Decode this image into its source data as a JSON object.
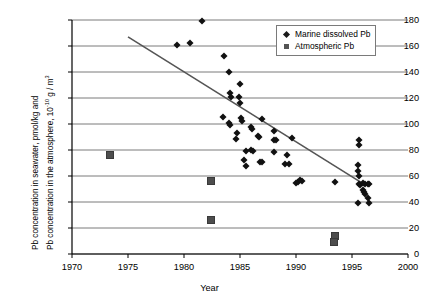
{
  "chart_data": {
    "type": "scatter",
    "title": "",
    "xlabel": "Year",
    "ylabel_line1": "Pb concentration in seawater, pmol/kg and",
    "ylabel_line2_pre": "Pb concentration in the atmosphere, 10",
    "ylabel_line2_sup": "-10",
    "ylabel_line2_post": " g / m",
    "ylabel_line2_sup2": "3",
    "xlim": [
      1970,
      2000
    ],
    "ylim": [
      0,
      180
    ],
    "xticks": [
      1970,
      1975,
      1980,
      1985,
      1990,
      1995,
      2000
    ],
    "yticks": [
      0,
      20,
      40,
      60,
      80,
      100,
      120,
      140,
      160,
      180
    ],
    "grid": "horizontal",
    "legend_position": "top-right",
    "colors": {
      "marine": "#111111",
      "atmospheric": "#4d4d4d",
      "trendline": "#555555",
      "grid": "#7a7a7a",
      "axis": "#000000"
    },
    "series": [
      {
        "name": "Marine dissolved Pb",
        "marker": "diamond",
        "points": [
          [
            1981.6,
            179.0
          ],
          [
            1979.4,
            160.5
          ],
          [
            1980.5,
            162.5
          ],
          [
            1983.6,
            152.5
          ],
          [
            1984.0,
            140.0
          ],
          [
            1985.0,
            131.0
          ],
          [
            1984.1,
            123.5
          ],
          [
            1984.2,
            120.5
          ],
          [
            1984.9,
            121.0
          ],
          [
            1985.0,
            116.0
          ],
          [
            1983.5,
            105.5
          ],
          [
            1984.0,
            100.5
          ],
          [
            1984.1,
            99.5
          ],
          [
            1985.1,
            104.5
          ],
          [
            1985.2,
            102.5
          ],
          [
            1987.0,
            103.5
          ],
          [
            1984.7,
            93.0
          ],
          [
            1986.0,
            97.5
          ],
          [
            1986.1,
            96.0
          ],
          [
            1984.6,
            88.5
          ],
          [
            1988.0,
            95.0
          ],
          [
            1986.6,
            91.0
          ],
          [
            1986.7,
            90.0
          ],
          [
            1988.0,
            88.0
          ],
          [
            1988.2,
            87.5
          ],
          [
            1989.6,
            89.5
          ],
          [
            1985.5,
            79.0
          ],
          [
            1986.0,
            80.0
          ],
          [
            1986.2,
            79.5
          ],
          [
            1988.0,
            78.5
          ],
          [
            1989.2,
            76.0
          ],
          [
            1985.4,
            72.0
          ],
          [
            1986.8,
            71.0
          ],
          [
            1987.0,
            70.5
          ],
          [
            1989.0,
            69.0
          ],
          [
            1989.4,
            69.5
          ],
          [
            1985.5,
            67.5
          ],
          [
            1990.0,
            55.0
          ],
          [
            1990.2,
            55.5
          ],
          [
            1990.4,
            57.0
          ],
          [
            1990.5,
            56.5
          ],
          [
            1993.5,
            55.5
          ],
          [
            1995.6,
            88.0
          ],
          [
            1995.6,
            84.0
          ],
          [
            1995.5,
            68.5
          ],
          [
            1995.5,
            64.0
          ],
          [
            1995.6,
            60.0
          ],
          [
            1995.6,
            54.0
          ],
          [
            1995.7,
            53.0
          ],
          [
            1996.0,
            54.5
          ],
          [
            1996.2,
            54.0
          ],
          [
            1996.4,
            54.0
          ],
          [
            1996.5,
            53.5
          ],
          [
            1996.0,
            49.0
          ],
          [
            1996.1,
            47.5
          ],
          [
            1996.2,
            46.0
          ],
          [
            1995.5,
            39.5
          ],
          [
            1996.4,
            43.0
          ],
          [
            1996.5,
            39.0
          ]
        ]
      },
      {
        "name": "Atmospheric Pb",
        "marker": "square",
        "points": [
          [
            1973.4,
            76.0
          ],
          [
            1982.4,
            56.5
          ],
          [
            1982.4,
            26.0
          ],
          [
            1993.5,
            14.0
          ],
          [
            1993.4,
            9.0
          ]
        ]
      }
    ],
    "trendline": {
      "name": "linear trend",
      "x_start": 1975.0,
      "y_start": 167.0,
      "x_end": 1996.2,
      "y_end": 53.0
    }
  },
  "legend": {
    "items": [
      {
        "label": "Marine dissolved Pb",
        "marker": "diamond"
      },
      {
        "label": "Atmospheric Pb",
        "marker": "square"
      }
    ]
  },
  "axis_text": {
    "xlabel": "Year",
    "yticks": [
      "180",
      "160",
      "140",
      "120",
      "100",
      "80",
      "60",
      "40",
      "20",
      "0"
    ],
    "xticks": [
      "1970",
      "1975",
      "1980",
      "1985",
      "1990",
      "1995",
      "2000"
    ]
  }
}
